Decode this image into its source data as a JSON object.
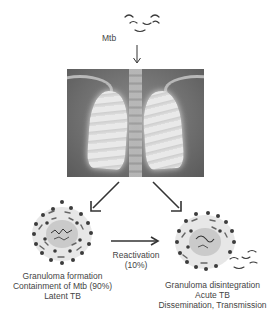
{
  "diagram": {
    "pathogen_label": "Mtb",
    "center_image": "chest-xray-lungs",
    "left_outcome": {
      "lines": [
        "Granuloma formation",
        "Containment of Mtb (90%)",
        "Latent TB"
      ]
    },
    "transition": {
      "lines": [
        "Reactivation",
        "(10%)"
      ]
    },
    "right_outcome": {
      "lines": [
        "Granuloma disintegration",
        "Acute TB",
        "Dissemination, Transmission"
      ]
    },
    "colors": {
      "text": "#444444",
      "arrow": "#333333",
      "cell_dark": "#3c3c3c",
      "cell_light": "#9a9a9a"
    }
  }
}
